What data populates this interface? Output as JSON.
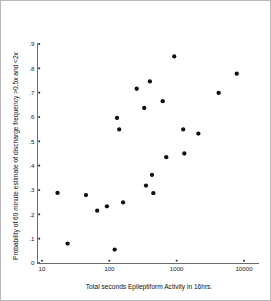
{
  "chart_data": {
    "type": "scatter",
    "title": "",
    "xlabel": "Total seconds Epileptiform Activity in 16hrs.",
    "ylabel": "Probability of 60 minute estimate of discharge frequency >0.5x and <2x",
    "xscale": "log",
    "yscale": "linear",
    "xlim": [
      10,
      10000
    ],
    "ylim": [
      0,
      0.9
    ],
    "grid": false,
    "legend": null,
    "xticks": [
      10,
      100,
      1000,
      10000
    ],
    "xtick_labels": [
      "10",
      "100",
      "1000",
      "10000"
    ],
    "yticks": [
      0,
      0.1,
      0.2,
      0.3,
      0.4,
      0.5,
      0.6,
      0.7,
      0.8,
      0.9
    ],
    "ytick_labels": [
      "0",
      ".1",
      ".2",
      ".3",
      ".4",
      ".5",
      ".6",
      ".7",
      ".8",
      ".9"
    ],
    "marker": "circle",
    "marker_color": "#101010",
    "marker_size": 3.2,
    "points": [
      {
        "x": 17,
        "y": 0.288
      },
      {
        "x": 24,
        "y": 0.08
      },
      {
        "x": 45,
        "y": 0.279
      },
      {
        "x": 66,
        "y": 0.215
      },
      {
        "x": 92,
        "y": 0.233
      },
      {
        "x": 120,
        "y": 0.055
      },
      {
        "x": 130,
        "y": 0.596
      },
      {
        "x": 140,
        "y": 0.549
      },
      {
        "x": 160,
        "y": 0.249
      },
      {
        "x": 255,
        "y": 0.716
      },
      {
        "x": 330,
        "y": 0.637
      },
      {
        "x": 350,
        "y": 0.318
      },
      {
        "x": 400,
        "y": 0.746
      },
      {
        "x": 430,
        "y": 0.362
      },
      {
        "x": 450,
        "y": 0.287
      },
      {
        "x": 620,
        "y": 0.665
      },
      {
        "x": 700,
        "y": 0.435
      },
      {
        "x": 920,
        "y": 0.849
      },
      {
        "x": 1250,
        "y": 0.549
      },
      {
        "x": 1300,
        "y": 0.45
      },
      {
        "x": 2100,
        "y": 0.532
      },
      {
        "x": 4200,
        "y": 0.699
      },
      {
        "x": 7800,
        "y": 0.778
      }
    ]
  },
  "axes": {
    "x_axis_name": "x-axis",
    "y_axis_name": "y-axis"
  }
}
